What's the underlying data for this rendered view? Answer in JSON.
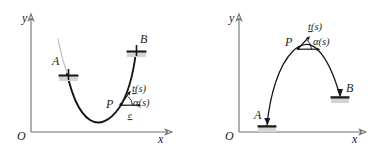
{
  "figure": {
    "background": "#ffffff",
    "ink": "#141414",
    "axis_color": "#6e6e6e",
    "ghost_color": "#b9b9b9",
    "panel_count": 2
  },
  "panels": [
    {
      "id": "left",
      "name": "hanging-cable-panel",
      "curve_shape": "catenary-sagging",
      "axes": {
        "origin_label": "O",
        "x_label": "x",
        "y_label": "y"
      },
      "points": [
        {
          "key": "A",
          "label": "A",
          "role": "left-anchor",
          "marker": "pin-support"
        },
        {
          "key": "B",
          "label": "B",
          "role": "right-anchor",
          "marker": "pin-support"
        },
        {
          "key": "P",
          "label": "P",
          "role": "generic-point",
          "marker": "none"
        }
      ],
      "annotations": [
        {
          "key": "t",
          "label": "t(s)",
          "role": "tangent-vector-label"
        },
        {
          "key": "alpha",
          "label": "α(s)",
          "role": "angle-label"
        },
        {
          "key": "e",
          "label": "e",
          "role": "unit-basis-vector-label"
        }
      ]
    },
    {
      "id": "right",
      "name": "arch-panel",
      "curve_shape": "inverted-arch",
      "axes": {
        "origin_label": "O",
        "x_label": "x",
        "y_label": "y"
      },
      "points": [
        {
          "key": "A",
          "label": "A",
          "role": "left-base",
          "marker": "fixed-support"
        },
        {
          "key": "B",
          "label": "B",
          "role": "right-base",
          "marker": "fixed-support"
        },
        {
          "key": "P",
          "label": "P",
          "role": "generic-point",
          "marker": "none"
        }
      ],
      "annotations": [
        {
          "key": "t",
          "label": "t(s)",
          "role": "tangent-vector-label"
        },
        {
          "key": "alpha",
          "label": "α(s)",
          "role": "angle-label"
        }
      ]
    }
  ]
}
